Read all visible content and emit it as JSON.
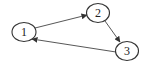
{
  "diagram": {
    "type": "directed-graph",
    "nodes": [
      {
        "id": "1",
        "label": "1",
        "cx": 24,
        "cy": 32,
        "rx": 12,
        "ry": 9.5
      },
      {
        "id": "2",
        "label": "2",
        "cx": 98,
        "cy": 13,
        "rx": 11.5,
        "ry": 9.5
      },
      {
        "id": "3",
        "label": "3",
        "cx": 127,
        "cy": 51,
        "rx": 11.5,
        "ry": 9.5
      }
    ],
    "edges": [
      {
        "from": "1",
        "to": "2"
      },
      {
        "from": "2",
        "to": "3"
      },
      {
        "from": "3",
        "to": "1"
      }
    ],
    "colors": {
      "stroke": "#333333",
      "fill": "#ffffff",
      "background": "#ffffff"
    }
  }
}
